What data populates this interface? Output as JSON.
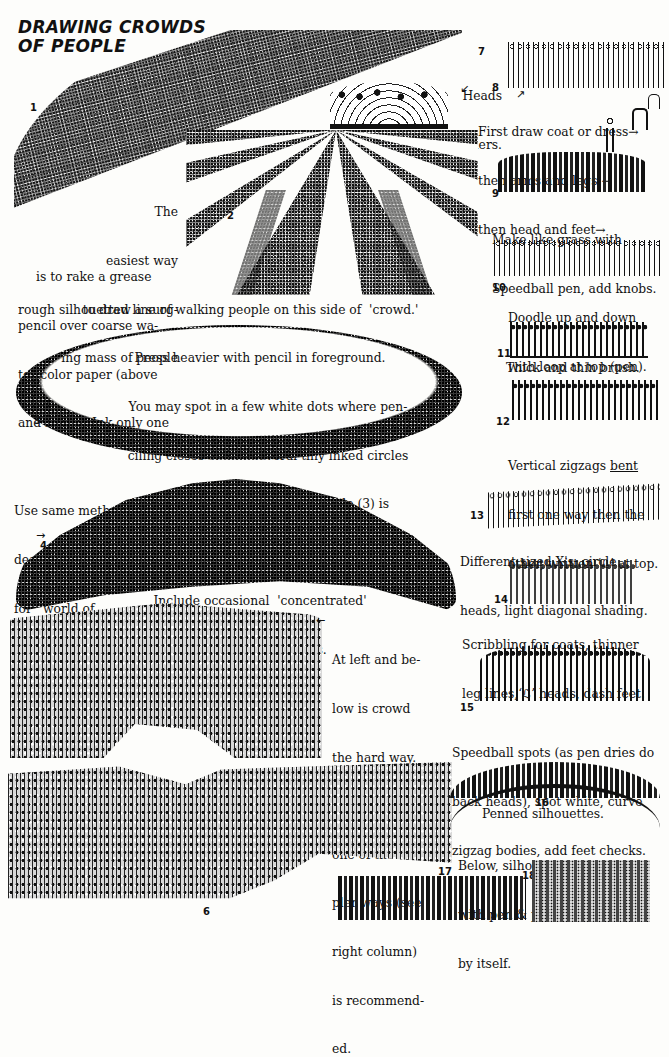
{
  "page": {
    "title_line1": "DRAWING CROWDS",
    "title_line2": "OF PEOPLE",
    "paper_color": "#fdfdfb",
    "ink_color": "#111111"
  },
  "figures": {
    "f1": {
      "number": "1",
      "description": "Grease-pencil crowd band curving across the top"
    },
    "f2": {
      "number": "2",
      "description": "Rows of crowd converging to a vanishing point"
    },
    "f3": {
      "number": "3",
      "description": "Circle of people with vertical treatment"
    },
    "f4": {
      "number": "4",
      "description": "Dome-shaped 'world of people'"
    },
    "f5": {
      "description": "Detailed crowd seen from behind, the hard way"
    },
    "f6": {
      "number": "6",
      "description": "Large outdoor crowd, rear view"
    },
    "f7": {
      "number": "7",
      "label_line1": "Heads",
      "label_line2": "& shoulders."
    },
    "f8": {
      "number": "8",
      "line1": "First draw coat or dress",
      "line2": "then arms and legs",
      "line3": "then head and feet"
    },
    "f9": {
      "number": "9",
      "line1": "Make like grass with",
      "line2": "Speedball pen, add knobs."
    },
    "f10": {
      "number": "10",
      "line1": "Doodle up and down",
      "line2": "with loop at top (pen)."
    },
    "f11": {
      "number": "11",
      "line1": "Thick and thin brush."
    },
    "f12": {
      "number": "12",
      "line1_a": "Vertical zigzags ",
      "line1_b": "bent",
      "line2": "first one way then the",
      "line3": "other, written ‘ℒ’ at top."
    },
    "f13": {
      "number": "13",
      "line1": "Different sized X's, circle",
      "line2": "heads, light diagonal shading."
    },
    "f14": {
      "number": "14",
      "line1": "Scribbling for coats, thinner",
      "line2": "leg lines,‘ℒ’ heads, dash feet."
    },
    "f15": {
      "number": "15",
      "line1": "Speedball spots (as pen dries do",
      "line2": "back heads), spot white, curve",
      "line3": "zigzag bodies, add feet checks."
    },
    "f16": {
      "number": "16",
      "line1": "Penned silhouettes."
    },
    "f16_below": {
      "line1": "Below, silhouettes on coquille",
      "line2": "with pen & pencil or pencil",
      "line3": "by itself."
    },
    "f17": {
      "number": "17"
    },
    "f18": {
      "number": "18"
    }
  },
  "text_blocks": {
    "intro": [
      "The",
      "easiest way",
      "to draw a surg-",
      "ing mass of people",
      "is to rake a grease",
      "pencil over coarse wa-",
      "ter-color paper (above",
      "and right).  Ink only one"
    ],
    "intro_cont": "rough silhouetted line of walking people on this side of  'crowd.'",
    "circle": [
      "Press heavier with pencil in foreground.",
      "You may spot in a few white dots where pen-",
      "ciling closes or add several tiny inked circles",
      "in open areas.  This circle of people (3) is",
      "done with more of a vertical treatment.",
      "Include occasional  'concentrated'",
      "heads, bodies & legs."
    ],
    "world": [
      "Use same method",
      "described above",
      "for  'world of",
      "people.'"
    ],
    "hard_way": [
      "At left and be-",
      "low is crowd",
      "the hard way.",
      "For cartooning,",
      "one of the sim-",
      "pler ways (see",
      "right column)",
      "is recommend-",
      "ed."
    ]
  },
  "arrows": {
    "right": "→",
    "left": "←",
    "up_right": "↗",
    "down_left": "↙"
  }
}
